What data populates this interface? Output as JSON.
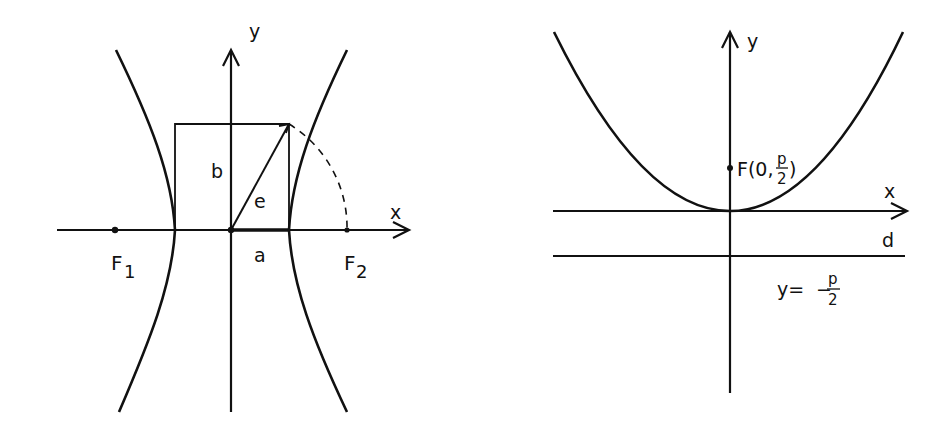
{
  "hyperbola_figure": {
    "axis_x_label": "x",
    "axis_y_label": "y",
    "focus1_label": "F",
    "focus1_sub": "1",
    "focus2_label": "F",
    "focus2_sub": "2",
    "semi_axis_a_label": "a",
    "semi_axis_b_label": "b",
    "eccentricity_label": "e"
  },
  "parabola_figure": {
    "axis_x_label": "x",
    "axis_y_label": "y",
    "focus_label_prefix": "F(0,",
    "focus_label_num": "p",
    "focus_label_den": "2",
    "focus_label_suffix": ")",
    "directrix_label": "d",
    "directrix_eq_prefix": "y=",
    "directrix_eq_sign": "−",
    "directrix_eq_num": "p",
    "directrix_eq_den": "2"
  },
  "colors": {
    "ink": "#111111",
    "background": "#ffffff"
  }
}
